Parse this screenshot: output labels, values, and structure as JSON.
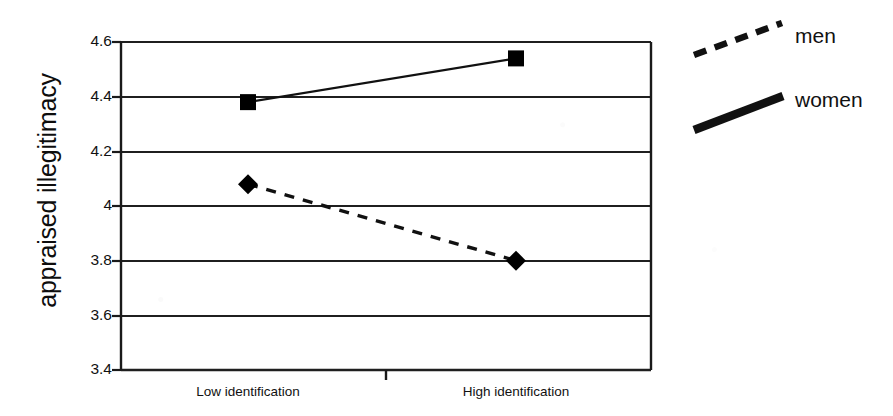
{
  "chart_data": {
    "type": "line",
    "title": "",
    "xlabel": "",
    "ylabel": "appraised illegitimacy",
    "categories": [
      "Low identification",
      "High identification"
    ],
    "ylim": [
      3.4,
      4.6
    ],
    "yticks": [
      "3.4",
      "3.6",
      "3.8",
      "4",
      "4.2",
      "4.4",
      "4.6"
    ],
    "ytick_values": [
      3.4,
      3.6,
      3.8,
      4.0,
      4.2,
      4.4,
      4.6
    ],
    "grid": "horizontal",
    "legend_position": "right",
    "series": [
      {
        "name": "men",
        "values": [
          4.08,
          3.8
        ],
        "line_style": "dashed",
        "marker": "diamond",
        "color": "#000000"
      },
      {
        "name": "women",
        "values": [
          4.38,
          4.54
        ],
        "line_style": "solid",
        "marker": "square",
        "color": "#000000"
      }
    ]
  },
  "figure": {
    "y_axis_title": "appraised illegitimacy",
    "x_tick_labels": [
      "Low identification",
      "High identification"
    ],
    "y_tick_labels": [
      "4.6",
      "4.4",
      "4.2",
      "4",
      "3.8",
      "3.6",
      "3.4"
    ],
    "legend": {
      "entries": [
        {
          "label": "men",
          "style": "dashed-line"
        },
        {
          "label": "women",
          "style": "thick-solid-line"
        }
      ]
    },
    "colors": {
      "ink": "#111111",
      "axis": "#1a1a1a",
      "grid": "#1f1f1f",
      "background": "#ffffff"
    }
  }
}
